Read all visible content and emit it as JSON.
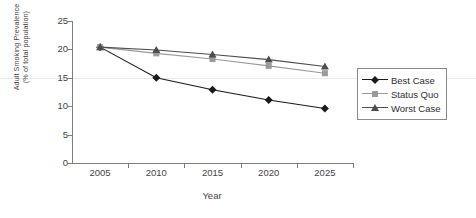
{
  "chart_data": {
    "type": "line",
    "title": "",
    "xlabel": "Year",
    "ylabel": "Adult Smoking Prevalence (% of total population)",
    "ylabel_line1": "Adult Smoking Prevalence",
    "ylabel_line2": "(% of total population)",
    "categories": [
      2005,
      2010,
      2015,
      2020,
      2025
    ],
    "x_tick_labels": [
      "2005",
      "2010",
      "2015",
      "2020",
      "2025"
    ],
    "y_tick_labels": [
      "0",
      "5",
      "10",
      "15",
      "20",
      "25"
    ],
    "y_ticks": [
      0,
      5,
      10,
      15,
      20,
      25
    ],
    "ylim": [
      0,
      25
    ],
    "grid": "horizontal-single-at-15",
    "legend_position": "right",
    "series": [
      {
        "name": "Best Case",
        "marker": "diamond",
        "color": "#1a1a1a",
        "values": [
          20.4,
          15.0,
          12.9,
          11.1,
          9.6
        ]
      },
      {
        "name": "Status Quo",
        "marker": "square",
        "color": "#9a9a9a",
        "values": [
          20.4,
          19.3,
          18.3,
          17.1,
          15.8
        ]
      },
      {
        "name": "Worst Case",
        "marker": "triangle",
        "color": "#4d4d4d",
        "values": [
          20.4,
          19.9,
          19.1,
          18.2,
          17.0
        ]
      }
    ]
  },
  "legend": {
    "items": [
      {
        "label": "Best Case"
      },
      {
        "label": "Status Quo"
      },
      {
        "label": "Worst Case"
      }
    ]
  }
}
